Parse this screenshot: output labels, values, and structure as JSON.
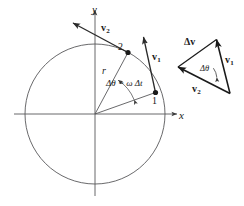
{
  "figure": {
    "axes": {
      "x_label": "x",
      "y_label": "y"
    },
    "circle": {
      "radius_label": "r"
    },
    "points": [
      {
        "id": "point-1",
        "label": "1"
      },
      {
        "id": "point-2",
        "label": "2"
      }
    ],
    "angle": {
      "circle_label": "Δθ = ω Δt",
      "triangle_label": "Δθ"
    },
    "vectors": {
      "v1_base": "v",
      "v1_sub": "1",
      "v2_base": "v",
      "v2_sub": "2",
      "dv_label": "Δv"
    },
    "colors": {
      "line": "#3c3c3c",
      "heavy": "#1a1a1a",
      "text": "#1a1a1a",
      "background": "#ffffff"
    }
  }
}
